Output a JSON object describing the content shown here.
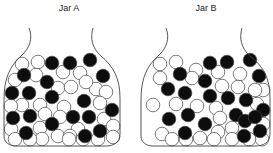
{
  "jars": [
    {
      "title": "Jar A",
      "title_x": 39,
      "offset_x": 0,
      "black": [
        [
          52,
          63
        ],
        [
          70,
          63
        ],
        [
          90,
          60
        ],
        [
          24,
          75
        ],
        [
          47,
          82
        ],
        [
          103,
          76
        ],
        [
          12,
          93
        ],
        [
          29,
          93
        ],
        [
          52,
          97
        ],
        [
          84,
          101
        ],
        [
          112,
          110
        ],
        [
          13,
          118
        ],
        [
          30,
          116
        ],
        [
          73,
          117
        ],
        [
          89,
          117
        ],
        [
          52,
          124
        ],
        [
          26,
          133
        ],
        [
          85,
          136
        ],
        [
          100,
          131
        ]
      ],
      "white": [
        [
          22,
          64
        ],
        [
          38,
          62
        ],
        [
          63,
          72
        ],
        [
          80,
          73
        ],
        [
          96,
          89
        ],
        [
          15,
          80
        ],
        [
          36,
          75
        ],
        [
          58,
          88
        ],
        [
          71,
          87
        ],
        [
          86,
          82
        ],
        [
          106,
          92
        ],
        [
          40,
          105
        ],
        [
          22,
          105
        ],
        [
          64,
          107
        ],
        [
          100,
          103
        ],
        [
          10,
          106
        ],
        [
          45,
          114
        ],
        [
          60,
          117
        ],
        [
          104,
          119
        ],
        [
          115,
          126
        ],
        [
          78,
          129
        ],
        [
          40,
          128
        ],
        [
          11,
          129
        ],
        [
          58,
          136
        ],
        [
          70,
          136
        ],
        [
          42,
          139
        ],
        [
          15,
          140
        ],
        [
          113,
          137
        ],
        [
          98,
          144
        ],
        [
          30,
          144
        ],
        [
          69,
          144
        ],
        [
          83,
          147
        ]
      ]
    },
    {
      "title": "Jar B",
      "title_x": 176,
      "offset_x": 137,
      "black": [
        [
          210,
          63
        ],
        [
          227,
          62
        ],
        [
          250,
          60
        ],
        [
          180,
          74
        ],
        [
          205,
          81
        ],
        [
          259,
          76
        ],
        [
          168,
          89
        ],
        [
          185,
          93
        ],
        [
          210,
          96
        ],
        [
          228,
          98
        ],
        [
          246,
          100
        ],
        [
          267,
          110
        ],
        [
          169,
          119
        ],
        [
          188,
          115
        ],
        [
          236,
          115
        ],
        [
          245,
          121
        ],
        [
          255,
          117
        ],
        [
          205,
          124
        ],
        [
          185,
          133
        ],
        [
          244,
          136
        ],
        [
          260,
          131
        ]
      ],
      "white": [
        [
          160,
          64
        ],
        [
          176,
          62
        ],
        [
          196,
          70
        ],
        [
          218,
          72
        ],
        [
          240,
          74
        ],
        [
          266,
          90
        ],
        [
          160,
          78
        ],
        [
          192,
          78
        ],
        [
          222,
          86
        ],
        [
          238,
          87
        ],
        [
          255,
          90
        ],
        [
          153,
          105
        ],
        [
          176,
          104
        ],
        [
          197,
          106
        ],
        [
          216,
          108
        ],
        [
          257,
          104
        ],
        [
          162,
          134
        ],
        [
          220,
          118
        ],
        [
          200,
          138
        ],
        [
          218,
          132
        ],
        [
          232,
          128
        ],
        [
          270,
          124
        ],
        [
          172,
          145
        ],
        [
          214,
          144
        ],
        [
          232,
          141
        ],
        [
          262,
          143
        ],
        [
          186,
          147
        ],
        [
          249,
          147
        ]
      ]
    }
  ],
  "colors": {
    "black_ball": "#0d0d0d",
    "white_ball": "#ffffff",
    "outline": "#444444"
  },
  "ball_radius": 6.8
}
